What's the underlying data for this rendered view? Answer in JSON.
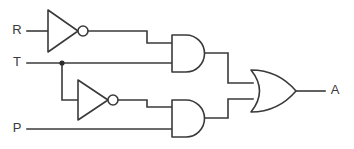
{
  "diagram": {
    "type": "digital-logic-schematic",
    "canvas": {
      "width": 354,
      "height": 149,
      "background": "#ffffff"
    },
    "style": {
      "line_color": "#3a3a3a",
      "fill_color": "#ffffff",
      "line_width": 1.6
    }
  },
  "labels": {
    "input_r": "R",
    "input_t": "T",
    "input_p": "P",
    "output_a": "A"
  },
  "inputs": [
    {
      "id": "R",
      "label": "R",
      "x": 17,
      "y": 31
    },
    {
      "id": "T",
      "label": "T",
      "x": 17,
      "y": 63
    },
    {
      "id": "P",
      "label": "P",
      "x": 17,
      "y": 129
    }
  ],
  "outputs": [
    {
      "id": "A",
      "label": "A",
      "x": 335,
      "y": 91
    }
  ],
  "gates": [
    {
      "id": "inv1",
      "type": "NOT",
      "label": "inverter",
      "inputs": [
        "R"
      ],
      "output": "not-R"
    },
    {
      "id": "inv2",
      "type": "NOT",
      "label": "inverter",
      "inputs": [
        "T"
      ],
      "output": "not-T"
    },
    {
      "id": "and1",
      "type": "AND",
      "label": "and-gate",
      "inputs": [
        "not-R",
        "T"
      ],
      "output": "and1-out"
    },
    {
      "id": "and2",
      "type": "AND",
      "label": "and-gate",
      "inputs": [
        "not-T",
        "P"
      ],
      "output": "and2-out"
    },
    {
      "id": "or1",
      "type": "OR",
      "label": "or-gate",
      "inputs": [
        "and1-out",
        "and2-out"
      ],
      "output": "A"
    }
  ],
  "junctions": [
    {
      "id": "t-branch",
      "net": "T",
      "x": 62,
      "y": 63
    }
  ],
  "geometry": {
    "inv1": {
      "x1": 48,
      "y_top": 10,
      "y_bot": 52,
      "apex_x": 78,
      "apex_y": 31,
      "bubble_cx": 83,
      "bubble_cy": 31,
      "bubble_r": 5
    },
    "inv2": {
      "x1": 78,
      "y_top": 80,
      "y_bot": 120,
      "apex_x": 108,
      "apex_y": 100,
      "bubble_cx": 113,
      "bubble_cy": 100,
      "bubble_r": 5
    },
    "and1": {
      "x_left": 172,
      "y_top": 35,
      "y_bot": 72,
      "x_right": 204,
      "in_top_y": 43,
      "in_bot_y": 63,
      "out_y": 53
    },
    "and2": {
      "x_left": 172,
      "y_top": 100,
      "y_bot": 137,
      "x_right": 204,
      "in_top_y": 107,
      "in_bot_y": 129,
      "out_y": 118
    },
    "or1": {
      "x_left": 251,
      "y_top": 70,
      "y_bot": 112,
      "x_tip": 296,
      "y_mid": 91,
      "in_top_y": 83,
      "in_bot_y": 99
    }
  },
  "paths": {
    "wire_r_in": "M 27 31 L 48 31",
    "wire_inv1_to_and1": "M 88 31 L 147 31 L 147 43 L 172 43",
    "wire_t_in": "M 27 63 L 172 63",
    "wire_t_branch_down": "M 62 63 L 62 100 L 78 100",
    "wire_inv2_to_and2": "M 118 100 L 147 100 L 147 107 L 172 107",
    "wire_p_in": "M 27 129 L 172 129",
    "wire_and1_to_or": "M 204 53 L 228 53 L 228 83 L 253 83",
    "wire_and2_to_or": "M 204 118 L 228 118 L 228 99 L 253 99",
    "wire_or_out": "M 296 91 L 325 91"
  }
}
